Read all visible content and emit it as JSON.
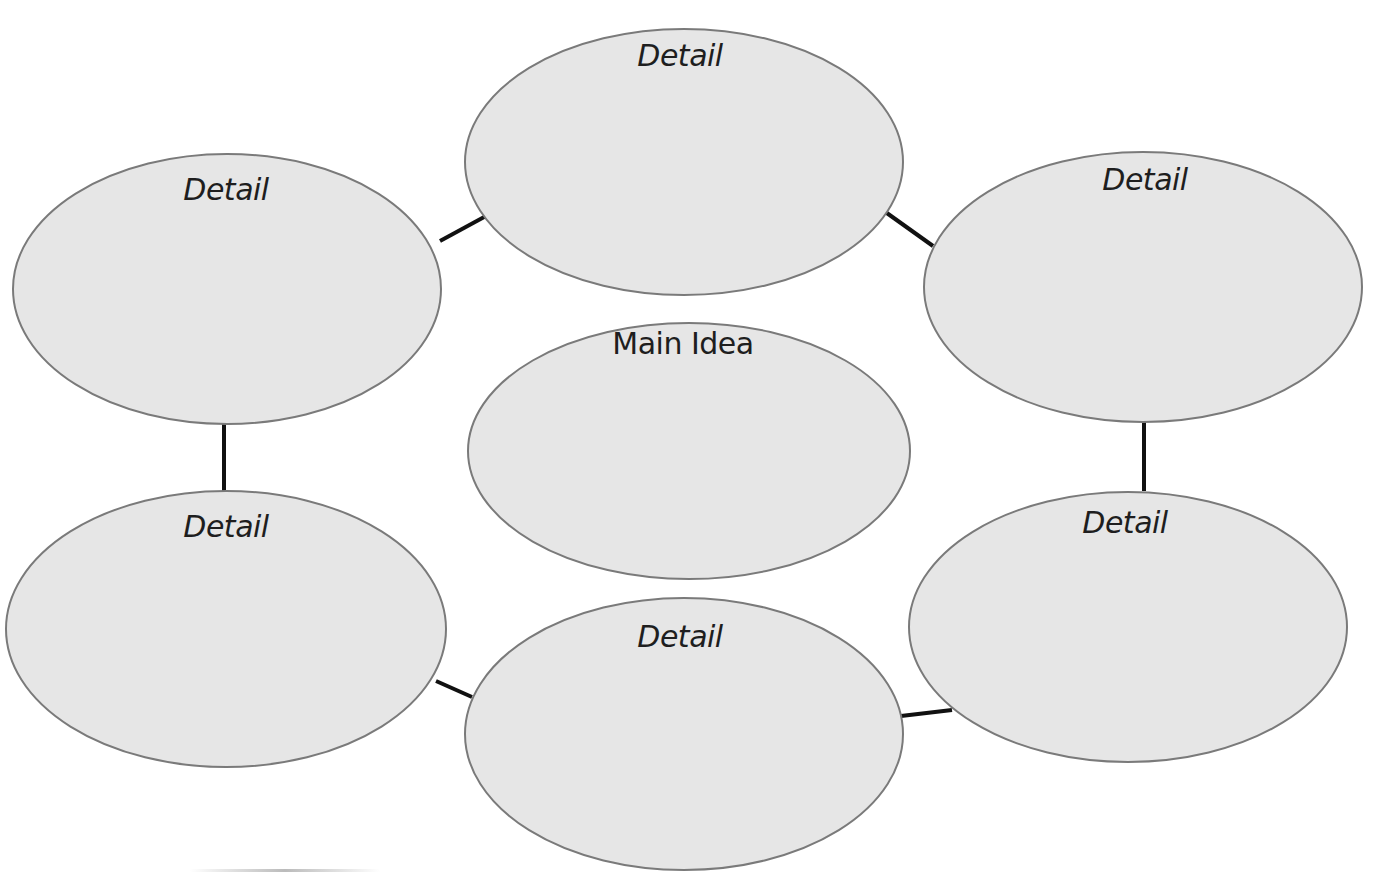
{
  "diagram": {
    "type": "concept-web",
    "center": {
      "label": "Main Idea",
      "cx": 689,
      "cy": 451,
      "rx": 221,
      "ry": 128
    },
    "nodes": [
      {
        "id": "top",
        "label": "Detail",
        "cx": 684,
        "cy": 162,
        "rx": 219,
        "ry": 133,
        "label_x": 680,
        "label_y": 38
      },
      {
        "id": "top-left",
        "label": "Detail",
        "cx": 227,
        "cy": 289,
        "rx": 214,
        "ry": 135,
        "label_x": 226,
        "label_y": 172
      },
      {
        "id": "top-right",
        "label": "Detail",
        "cx": 1143,
        "cy": 287,
        "rx": 219,
        "ry": 135,
        "label_x": 1145,
        "label_y": 162
      },
      {
        "id": "bottom-left",
        "label": "Detail",
        "cx": 226,
        "cy": 629,
        "rx": 220,
        "ry": 138,
        "label_x": 226,
        "label_y": 509
      },
      {
        "id": "bottom-right",
        "label": "Detail",
        "cx": 1128,
        "cy": 627,
        "rx": 219,
        "ry": 135,
        "label_x": 1125,
        "label_y": 505
      },
      {
        "id": "bottom",
        "label": "Detail",
        "cx": 684,
        "cy": 734,
        "rx": 219,
        "ry": 136,
        "label_x": 680,
        "label_y": 619
      }
    ],
    "connectors": [
      {
        "from": "top-left",
        "to": "top",
        "x1": 440,
        "y1": 241,
        "x2": 486,
        "y2": 216
      },
      {
        "from": "top",
        "to": "top-right",
        "x1": 884,
        "y1": 211,
        "x2": 933,
        "y2": 246
      },
      {
        "from": "top-left",
        "to": "bottom-left",
        "x1": 224,
        "y1": 424,
        "x2": 224,
        "y2": 491
      },
      {
        "from": "top-right",
        "to": "bottom-right",
        "x1": 1144,
        "y1": 422,
        "x2": 1144,
        "y2": 491
      },
      {
        "from": "bottom-left",
        "to": "bottom",
        "x1": 436,
        "y1": 681,
        "x2": 472,
        "y2": 697
      },
      {
        "from": "bottom",
        "to": "bottom-right",
        "x1": 901,
        "y1": 716,
        "x2": 952,
        "y2": 710
      }
    ],
    "colors": {
      "fill": "#e6e6e6",
      "stroke": "#7a7a7a",
      "connector": "#111111",
      "text": "#1e1e1e"
    }
  }
}
